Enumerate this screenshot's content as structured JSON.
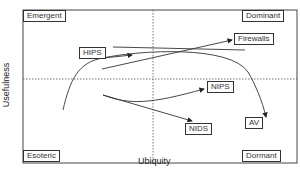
{
  "quadrants": {
    "top_left": "Emergent",
    "top_right": "Dominant",
    "bottom_left": "Esoteric",
    "bottom_right": "Dormant"
  },
  "axes": {
    "x_label": "Ubiquity",
    "y_label": "Usefulness"
  },
  "nodes": {
    "hips": "HIPS",
    "firewalls": "Firewalls",
    "nips": "NIPS",
    "nids": "NIDS",
    "av": "AV"
  },
  "colors": {
    "line": "#333333",
    "divider": "#555555"
  }
}
